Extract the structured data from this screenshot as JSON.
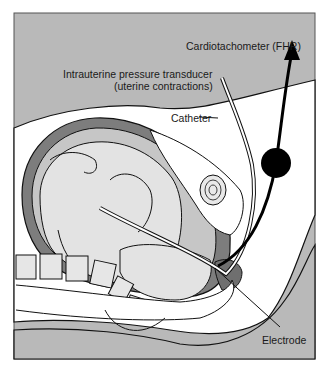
{
  "figure": {
    "labels": {
      "cardiotachometer": "Cardiotachometer (FHR)",
      "transducer_line1": "Intrauterine pressure transducer",
      "transducer_line2": "(uterine contractions)",
      "catheter": "Catheter",
      "electrode": "Electrode"
    },
    "colors": {
      "background_gray": "#b9b9b9",
      "skin_white": "#ffffff",
      "fetus_light_gray": "#e3e3e3",
      "uterine_wall_dark": "#7d7d7d",
      "amniotic_mid_gray": "#c6c6c6",
      "outline": "#111111"
    }
  }
}
